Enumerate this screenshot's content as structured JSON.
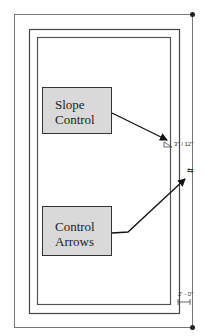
{
  "callouts": {
    "slope": {
      "line1": "Slope",
      "line2": "Control"
    },
    "arrows": {
      "line1": "Control",
      "line2": "Arrows"
    }
  },
  "annotations": {
    "slope_value": "3\" / 12\"",
    "flip_symbol": "⇆",
    "dimension": "2' - 0\""
  },
  "colors": {
    "callout_fill": "#d9d9d9",
    "line": "#333333",
    "wall_line": "#666666"
  }
}
